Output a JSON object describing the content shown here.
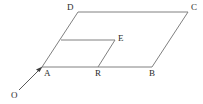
{
  "figure": {
    "kind": "geometry-diagram",
    "background_color": "#ffffff",
    "stroke_color": "#808080",
    "label_color": "#2b2b2b",
    "arrow_color": "#4a4a4a",
    "stroke_width": 1,
    "canvas": {
      "width": 203,
      "height": 104
    }
  },
  "points": {
    "A": {
      "label": "A",
      "x": 42,
      "y": 67,
      "label_x": 44,
      "label_y": 69
    },
    "B": {
      "label": "B",
      "x": 152,
      "y": 67,
      "label_x": 150,
      "label_y": 69
    },
    "C": {
      "label": "C",
      "x": 188,
      "y": 12,
      "label_x": 191,
      "label_y": 5
    },
    "D": {
      "label": "D",
      "x": 78,
      "y": 12,
      "label_x": 67,
      "label_y": 4
    },
    "E": {
      "label": "E",
      "x": 115,
      "y": 40,
      "label_x": 118,
      "label_y": 35
    },
    "R": {
      "label": "R",
      "x": 98,
      "y": 67,
      "label_x": 96,
      "label_y": 69
    },
    "O": {
      "label": "O",
      "x": 19,
      "y": 90,
      "label_x": 12,
      "label_y": 92
    },
    "F": {
      "label": "",
      "x": 61,
      "y": 40,
      "label_x": 0,
      "label_y": 0
    }
  },
  "segments": [
    {
      "name": "segment-A-D",
      "from": "A",
      "to": "D"
    },
    {
      "name": "segment-D-C",
      "from": "D",
      "to": "C"
    },
    {
      "name": "segment-C-B",
      "from": "C",
      "to": "B"
    },
    {
      "name": "segment-B-A",
      "from": "B",
      "to": "A"
    },
    {
      "name": "segment-F-E",
      "from": "F",
      "to": "E"
    },
    {
      "name": "segment-E-R",
      "from": "E",
      "to": "R"
    }
  ],
  "rays": [
    {
      "name": "ray-O-A",
      "from": "O",
      "to": "A",
      "arrowhead_at": "A"
    }
  ],
  "labels": [
    "D",
    "C",
    "E",
    "A",
    "R",
    "B",
    "O"
  ]
}
